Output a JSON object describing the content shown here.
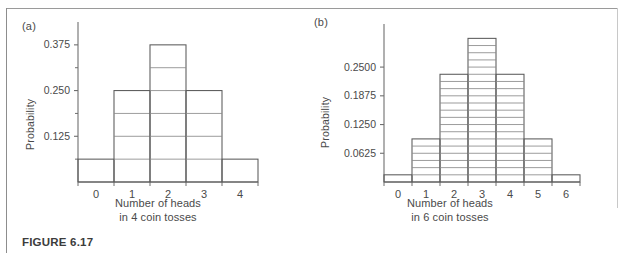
{
  "figure": {
    "caption": "FIGURE 6.17",
    "panels": [
      {
        "label": "(a)",
        "ylabel": "Probability",
        "xcaption_line1": "Number of heads",
        "xcaption_line2": "in 4 coin tosses"
      },
      {
        "label": "(b)",
        "ylabel": "Probability",
        "xcaption_line1": "Number of heads",
        "xcaption_line2": "in 6 coin tosses"
      }
    ]
  },
  "colors": {
    "axis": "#6f6f6f",
    "bar_stroke": "#5a5a5a",
    "subdivision": "#8a8a8a",
    "text": "#4a4a4a",
    "frame": "#8d8d8d",
    "background": "#ffffff"
  },
  "chart_data": [
    {
      "type": "bar",
      "title": "(a)",
      "xlabel": "Number of heads in 4 coin tosses",
      "ylabel": "Probability",
      "categories": [
        "0",
        "1",
        "2",
        "3",
        "4"
      ],
      "values": [
        0.0625,
        0.25,
        0.375,
        0.25,
        0.0625
      ],
      "ytick_labels": [
        "0.125",
        "0.250",
        "0.375"
      ],
      "ytick_values": [
        0.125,
        0.25,
        0.375
      ],
      "minor_tick_values": [
        0.0625,
        0.1875,
        0.3125
      ],
      "ylim": [
        0,
        0.4375
      ],
      "xlim": [
        -0.5,
        4.5
      ],
      "grid": false,
      "legend": "none",
      "block_unit": 0.0625,
      "annotation": "Each bar is subdivided into blocks of 1/16 = 0.0625"
    },
    {
      "type": "bar",
      "title": "(b)",
      "xlabel": "Number of heads in 6 coin tosses",
      "ylabel": "Probability",
      "categories": [
        "0",
        "1",
        "2",
        "3",
        "4",
        "5",
        "6"
      ],
      "values": [
        0.015625,
        0.09375,
        0.234375,
        0.3125,
        0.234375,
        0.09375,
        0.015625
      ],
      "ytick_labels": [
        "0.0625",
        "0.1250",
        "0.1875",
        "0.2500"
      ],
      "ytick_values": [
        0.0625,
        0.125,
        0.1875,
        0.25
      ],
      "minor_tick_values": [],
      "ylim": [
        0,
        0.34375
      ],
      "xlim": [
        -0.5,
        6.5
      ],
      "grid": false,
      "legend": "none",
      "block_unit": 0.015625,
      "annotation": "Each bar is subdivided into blocks of 1/64 = 0.015625"
    }
  ]
}
